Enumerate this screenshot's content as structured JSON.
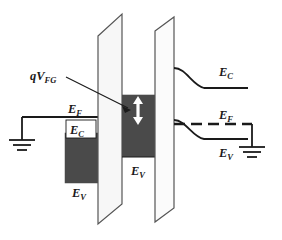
{
  "figure": {
    "type": "band-diagram",
    "colors": {
      "ink": "#1a1a1a",
      "filled_band": "#4a4a4a",
      "barrier_fill": "#f2f2f2",
      "barrier_edge": "#555555",
      "background": "#ffffff",
      "arrow": "#ffffff"
    }
  },
  "labels": {
    "qvfg": {
      "symbol": "qV",
      "subscript": "FG",
      "x": 30,
      "y": 80
    },
    "left_ef": {
      "symbol": "E",
      "subscript": "F",
      "x": 68,
      "y": 104
    },
    "left_ec": {
      "symbol": "E",
      "subscript": "C",
      "x": 68,
      "y": 129
    },
    "left_ev": {
      "symbol": "E",
      "subscript": "V",
      "x": 72,
      "y": 193
    },
    "mid_ev": {
      "symbol": "E",
      "subscript": "V",
      "x": 133,
      "y": 170
    },
    "right_ec": {
      "symbol": "E",
      "subscript": "C",
      "x": 224,
      "y": 72
    },
    "right_ef": {
      "symbol": "E",
      "subscript": "F",
      "x": 224,
      "y": 115
    },
    "right_ev": {
      "symbol": "E",
      "subscript": "V",
      "x": 224,
      "y": 152
    }
  },
  "elements": {
    "left_ground": "ground-symbol-left",
    "right_ground": "ground-symbol-right",
    "barrier_left": "tunnel-oxide-barrier",
    "barrier_right": "control-oxide-barrier",
    "floating_gate": "floating-gate-region",
    "leader_line": "qvfg-leader-line",
    "double_arrow": "energy-offset-double-arrow",
    "fermi_dashed": "right-fermi-dashed-line"
  }
}
